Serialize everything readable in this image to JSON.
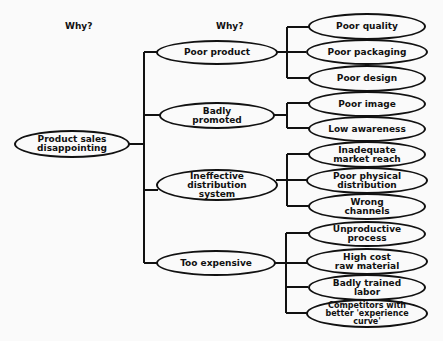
{
  "headers": {
    "col1": "Why?",
    "col2": "Why?"
  },
  "root": {
    "label": "Product sales\ndisappointing"
  },
  "causes": [
    {
      "label": "Poor product",
      "subcauses": [
        "Poor quality",
        "Poor packaging",
        "Poor design"
      ]
    },
    {
      "label": "Badly\npromoted",
      "subcauses": [
        "Poor image",
        "Low awareness"
      ]
    },
    {
      "label": "Ineffective\ndistribution\nsystem",
      "subcauses": [
        "Inadequate\nmarket reach",
        "Poor physical\ndistribution",
        "Wrong\nchannels"
      ]
    },
    {
      "label": "Too expensive",
      "subcauses": [
        "Unproductive\nprocess",
        "High cost\nraw material",
        "Badly trained\nlabor",
        "Competitors with\nbetter 'experience\ncurve'"
      ]
    }
  ]
}
